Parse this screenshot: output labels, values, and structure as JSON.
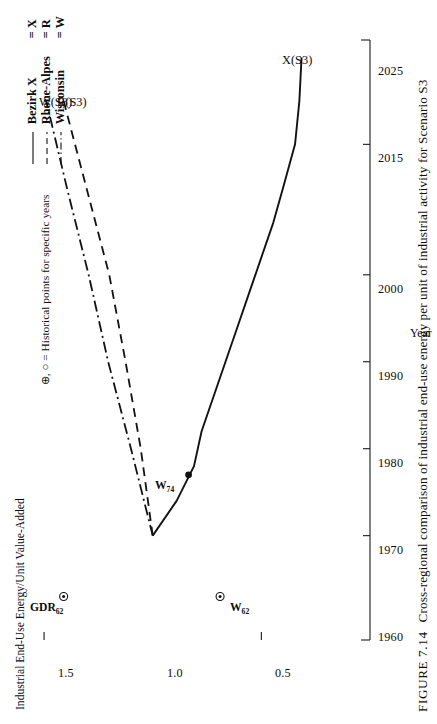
{
  "figure": {
    "number": "FIGURE 7.14",
    "caption": "Cross-regional comparison of industrial end-use energy per unit of industrial activity for Scenario S3"
  },
  "note": "⊕, ○ = Historical points for specific years",
  "legend": {
    "position": "top-right",
    "items": [
      {
        "name": "Bezirk X",
        "eq": "= X",
        "style": "solid",
        "key_name": "legend-key-solid"
      },
      {
        "name": "Rhone-Alpes",
        "eq": "= R",
        "style": "dashed",
        "key_name": "legend-key-dashed"
      },
      {
        "name": "Wisconsin",
        "eq": "= W",
        "style": "dashdot",
        "key_name": "legend-key-dashdot"
      }
    ]
  },
  "chart_data": {
    "type": "line",
    "title": "Cross-regional comparison of industrial end-use energy per unit of industrial activity for Scenario S3",
    "xlabel": "Year",
    "ylabel": "Industrial End-Use Energy/Unit Value-Added",
    "xticks": [
      1960,
      1970,
      1980,
      1990,
      2000,
      2015,
      2025
    ],
    "xticklabels": [
      "1960",
      "1970",
      "1980",
      "1990",
      "2000",
      "2015",
      "2025"
    ],
    "yticks": [
      0.5,
      1.0,
      1.5
    ],
    "yticklabels": [
      "0.5",
      "1.0",
      "1.5"
    ],
    "xlim": [
      1958,
      2027
    ],
    "ylim": [
      0.0,
      1.62
    ],
    "grid": false,
    "series": [
      {
        "name": "X(S3)",
        "label": "X(S3)",
        "region": "Bezirk X",
        "style": "solid",
        "x": [
          1970,
          1974,
          1978,
          1982,
          1986,
          1990,
          1994,
          1998,
          2002,
          2006,
          2010,
          2015,
          2020,
          2025
        ],
        "y": [
          1.0,
          0.89,
          0.81,
          0.775,
          0.72,
          0.665,
          0.61,
          0.555,
          0.5,
          0.445,
          0.4,
          0.345,
          0.325,
          0.315
        ]
      },
      {
        "name": "R(S3)",
        "label": "R(S3)",
        "region": "Rhone-Alpes",
        "style": "dashed",
        "x": [
          1970,
          1980,
          1990,
          2000,
          2010,
          2020
        ],
        "y": [
          1.0,
          1.055,
          1.125,
          1.2,
          1.305,
          1.41
        ]
      },
      {
        "name": "W(S3)",
        "label": "W(S3)",
        "region": "Wisconsin",
        "style": "dashdot",
        "x": [
          1970,
          1980,
          1990,
          2000,
          2010,
          2020
        ],
        "y": [
          1.0,
          1.1,
          1.205,
          1.295,
          1.395,
          1.49
        ]
      }
    ],
    "historical_points": [
      {
        "label": "GDR",
        "sub": "62",
        "marker": "crossed-circle",
        "x": 1963,
        "y": 1.41,
        "label_side": "left"
      },
      {
        "label": "W",
        "sub": "62",
        "marker": "crossed-circle",
        "x": 1963,
        "y": 0.69,
        "label_side": "right"
      },
      {
        "label": "W",
        "sub": "74",
        "marker": "filled-dot",
        "x": 1977,
        "y": 0.835,
        "label_side": "left"
      }
    ]
  },
  "colors": {
    "line": "#121212",
    "axis": "#1a1a1a",
    "background": "#ffffff"
  }
}
